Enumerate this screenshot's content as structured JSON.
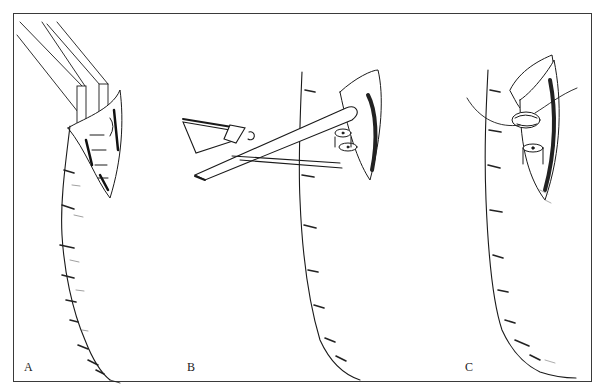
{
  "figure": {
    "type": "surgical illustration",
    "panel_count": 3,
    "border_color": "#3a3a3a",
    "line_color": "#1a1a1a",
    "background": "#ffffff"
  },
  "panels": [
    {
      "id": "A",
      "label": "A",
      "label_pos": [
        24,
        372
      ],
      "content": "clamp-applied-to-exposed-structure"
    },
    {
      "id": "B",
      "label": "B",
      "label_pos": [
        187,
        372
      ],
      "content": "scissors-dividing-structure"
    },
    {
      "id": "C",
      "label": "C",
      "label_pos": [
        465,
        372
      ],
      "content": "suture-closure-of-stump"
    }
  ]
}
